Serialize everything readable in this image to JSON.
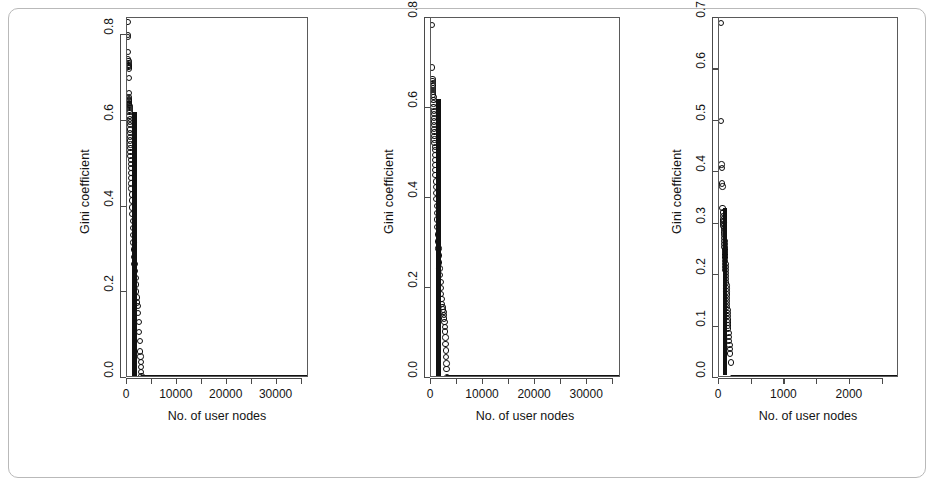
{
  "figure": {
    "panel_count": 3,
    "marker": "open-circle",
    "frame_color": "#b9b9b9",
    "axis_color": "#4a4a4a",
    "point_color": "#0d0d0d"
  },
  "chart_data": [
    {
      "type": "scatter",
      "title": "",
      "xlabel": "No. of user nodes",
      "ylabel": "Gini coefficient",
      "xlim": [
        0,
        36500
      ],
      "ylim": [
        0.0,
        0.84
      ],
      "grid": false,
      "legend": null,
      "xticks": [
        0,
        10000,
        20000,
        30000
      ],
      "xticklabels": [
        "0",
        "10000",
        "20000",
        "30000"
      ],
      "xminorticks": [
        5000,
        15000,
        25000,
        35000
      ],
      "yticks": [
        0.0,
        0.2,
        0.4,
        0.6,
        0.8
      ],
      "yticklabels": [
        "0.0",
        "0.2",
        "0.4",
        "0.6",
        "0.8"
      ],
      "x": [
        120,
        160,
        170,
        210,
        250,
        260,
        280,
        300,
        320,
        330,
        340,
        360,
        380,
        400,
        410,
        420,
        430,
        440,
        450,
        460,
        470,
        480,
        490,
        500,
        520,
        540,
        560,
        580,
        600,
        620,
        640,
        660,
        680,
        700,
        720,
        740,
        760,
        780,
        800,
        830,
        860,
        890,
        920,
        960,
        1000,
        1050,
        1100,
        1150,
        1200,
        1260,
        1320,
        1380,
        1450,
        1520,
        1600,
        1680,
        1760,
        1850,
        1950,
        2050,
        2150,
        2250,
        2350,
        2450,
        2550,
        2650,
        2700,
        2750,
        2800,
        2850,
        2900,
        3000,
        3200,
        3500,
        4000,
        4600,
        5300,
        6000,
        6800,
        7600,
        8400,
        9200,
        10000,
        10900,
        11800,
        12700,
        13600,
        14500,
        15400,
        16300,
        17200,
        18100,
        19000,
        19900,
        20800,
        21700,
        22600,
        23500,
        24400,
        25300,
        26200,
        27100,
        28000,
        28900,
        29800,
        30700,
        31600,
        32500,
        33400,
        34300,
        35200,
        36000
      ],
      "y": [
        0.83,
        0.8,
        0.795,
        0.76,
        0.745,
        0.74,
        0.735,
        0.73,
        0.728,
        0.725,
        0.722,
        0.7,
        0.665,
        0.655,
        0.65,
        0.648,
        0.645,
        0.642,
        0.64,
        0.638,
        0.635,
        0.63,
        0.625,
        0.62,
        0.612,
        0.605,
        0.598,
        0.59,
        0.58,
        0.572,
        0.563,
        0.554,
        0.545,
        0.536,
        0.527,
        0.518,
        0.509,
        0.5,
        0.49,
        0.478,
        0.466,
        0.454,
        0.442,
        0.428,
        0.414,
        0.398,
        0.382,
        0.366,
        0.35,
        0.333,
        0.316,
        0.3,
        0.283,
        0.266,
        0.249,
        0.233,
        0.218,
        0.202,
        0.188,
        0.176,
        0.168,
        0.152,
        0.13,
        0.108,
        0.086,
        0.062,
        0.05,
        0.038,
        0.026,
        0.014,
        0.004,
        0.0,
        0.0,
        0.0,
        0.0,
        0.0,
        0.0,
        0.0,
        0.0,
        0.0,
        0.0,
        0.0,
        0.0,
        0.0,
        0.0,
        0.0,
        0.0,
        0.0,
        0.0,
        0.0,
        0.0,
        0.0,
        0.0,
        0.0,
        0.0,
        0.0,
        0.0,
        0.0,
        0.0,
        0.0,
        0.0,
        0.0,
        0.0,
        0.0,
        0.0,
        0.0,
        0.0,
        0.0,
        0.0,
        0.0,
        0.0,
        0.0
      ],
      "notes": "Gini coefficient decays steeply near x=0 then is flat at 0 beyond ~3000 nodes"
    },
    {
      "type": "scatter",
      "title": "",
      "xlabel": "No. of user nodes",
      "ylabel": "Gini coefficient",
      "xlim": [
        0,
        36500
      ],
      "ylim": [
        0.0,
        0.8
      ],
      "grid": false,
      "legend": null,
      "xticks": [
        0,
        10000,
        20000,
        30000
      ],
      "xticklabels": [
        "0",
        "10000",
        "20000",
        "30000"
      ],
      "xminorticks": [
        5000,
        15000,
        25000,
        35000
      ],
      "yticks": [
        0.0,
        0.2,
        0.4,
        0.6,
        0.8
      ],
      "yticklabels": [
        "0.0",
        "0.2",
        "0.4",
        "0.6",
        "0.8"
      ],
      "x": [
        150,
        200,
        260,
        300,
        330,
        350,
        370,
        390,
        410,
        430,
        450,
        470,
        490,
        510,
        530,
        550,
        570,
        590,
        610,
        630,
        650,
        670,
        690,
        710,
        730,
        750,
        780,
        810,
        840,
        870,
        900,
        940,
        980,
        1020,
        1060,
        1110,
        1160,
        1210,
        1270,
        1330,
        1390,
        1450,
        1520,
        1590,
        1660,
        1730,
        1810,
        1890,
        1970,
        2050,
        2130,
        2210,
        2290,
        2370,
        2450,
        2530,
        2600,
        2650,
        2700,
        2750,
        2800,
        2850,
        2900,
        2950,
        3000,
        3100,
        3300,
        3700,
        4300,
        5000,
        5800,
        6700,
        7600,
        8500,
        9400,
        10300,
        11200,
        12100,
        13000,
        13900,
        14800,
        15700,
        16600,
        17500,
        18400,
        19300,
        20200,
        21100,
        22000,
        22900,
        23800,
        24700,
        25600,
        26500,
        27400,
        28300,
        29200,
        30100,
        31000,
        31900,
        32800,
        33700,
        34600,
        35400,
        36000
      ],
      "y": [
        0.785,
        0.69,
        0.665,
        0.66,
        0.655,
        0.65,
        0.645,
        0.64,
        0.635,
        0.63,
        0.625,
        0.618,
        0.61,
        0.602,
        0.594,
        0.586,
        0.578,
        0.57,
        0.562,
        0.554,
        0.546,
        0.538,
        0.53,
        0.522,
        0.514,
        0.506,
        0.495,
        0.484,
        0.473,
        0.462,
        0.451,
        0.437,
        0.424,
        0.411,
        0.398,
        0.382,
        0.367,
        0.352,
        0.335,
        0.319,
        0.303,
        0.288,
        0.272,
        0.257,
        0.243,
        0.229,
        0.214,
        0.2,
        0.187,
        0.175,
        0.165,
        0.158,
        0.152,
        0.146,
        0.14,
        0.132,
        0.124,
        0.114,
        0.103,
        0.09,
        0.076,
        0.061,
        0.046,
        0.032,
        0.02,
        0.002,
        0.0,
        0.0,
        0.0,
        0.0,
        0.0,
        0.0,
        0.0,
        0.0,
        0.0,
        0.0,
        0.0,
        0.0,
        0.0,
        0.0,
        0.0,
        0.0,
        0.0,
        0.0,
        0.0,
        0.0,
        0.0,
        0.0,
        0.0,
        0.0,
        0.0,
        0.0,
        0.0,
        0.0,
        0.0,
        0.0,
        0.0,
        0.0,
        0.0,
        0.0,
        0.0,
        0.0,
        0.0,
        0.0,
        0.0
      ],
      "notes": "Two isolated high outliers near 0.785 and 0.69, then dense decaying cluster"
    },
    {
      "type": "scatter",
      "title": "",
      "xlabel": "No. of user nodes",
      "ylabel": "Gini coefficient",
      "xlim": [
        0,
        2750
      ],
      "ylim": [
        0.0,
        0.7
      ],
      "grid": false,
      "legend": null,
      "xticks": [
        0,
        1000,
        2000
      ],
      "xticklabels": [
        "0",
        "1000",
        "2000"
      ],
      "xminorticks": [
        500,
        1500,
        2500
      ],
      "yticks": [
        0.0,
        0.1,
        0.2,
        0.3,
        0.4,
        0.5,
        0.6,
        0.7
      ],
      "yticklabels": [
        "0.0",
        "0.1",
        "0.2",
        "0.3",
        "0.4",
        "0.5",
        "0.6",
        "0.7"
      ],
      "x": [
        28,
        32,
        40,
        42,
        48,
        52,
        55,
        58,
        60,
        62,
        64,
        66,
        68,
        70,
        72,
        74,
        76,
        78,
        80,
        82,
        84,
        86,
        88,
        90,
        92,
        94,
        96,
        98,
        100,
        102,
        104,
        106,
        108,
        110,
        112,
        114,
        116,
        118,
        120,
        122,
        124,
        126,
        128,
        130,
        132,
        134,
        136,
        138,
        140,
        145,
        150,
        155,
        160,
        165,
        170,
        180,
        200,
        240,
        300,
        380,
        470,
        560,
        650,
        740,
        830,
        920,
        1010,
        1100,
        1190,
        1280,
        1370,
        1460,
        1550,
        1640,
        1730,
        1820,
        1910,
        2000,
        2090,
        2180,
        2270,
        2360,
        2450,
        2540,
        2620,
        2700
      ],
      "y": [
        0.69,
        0.5,
        0.415,
        0.408,
        0.378,
        0.372,
        0.33,
        0.322,
        0.315,
        0.308,
        0.305,
        0.302,
        0.3,
        0.296,
        0.292,
        0.288,
        0.283,
        0.278,
        0.272,
        0.266,
        0.26,
        0.255,
        0.25,
        0.245,
        0.24,
        0.234,
        0.228,
        0.222,
        0.216,
        0.21,
        0.204,
        0.198,
        0.192,
        0.186,
        0.18,
        0.174,
        0.168,
        0.162,
        0.156,
        0.15,
        0.144,
        0.138,
        0.132,
        0.126,
        0.12,
        0.114,
        0.108,
        0.102,
        0.096,
        0.088,
        0.08,
        0.072,
        0.064,
        0.056,
        0.048,
        0.03,
        0.0,
        0.0,
        0.0,
        0.0,
        0.0,
        0.0,
        0.0,
        0.0,
        0.0,
        0.0,
        0.0,
        0.0,
        0.0,
        0.0,
        0.0,
        0.0,
        0.0,
        0.0,
        0.0,
        0.0,
        0.0,
        0.0,
        0.0,
        0.0,
        0.0,
        0.0,
        0.0,
        0.0,
        0.0,
        0.0,
        0.0
      ],
      "notes": "Narrow x range; sparse high outliers at 0.69 and 0.50, dense vertical cluster below 0.42"
    }
  ]
}
